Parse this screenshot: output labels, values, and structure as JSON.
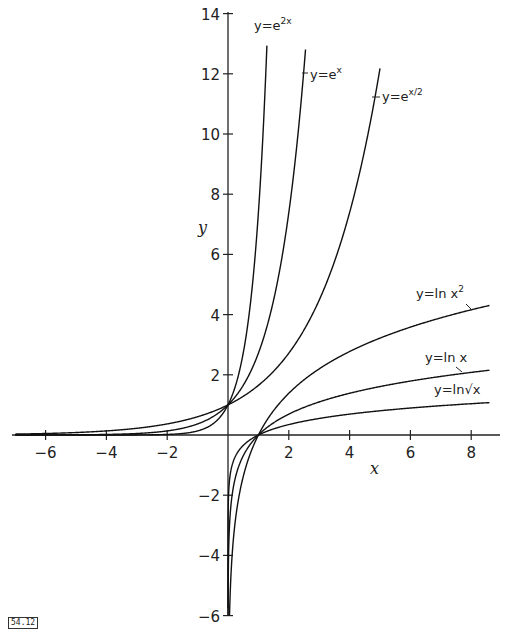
{
  "figure_id": "54.12",
  "chart_data": {
    "type": "line",
    "title": "",
    "xlabel": "x",
    "ylabel": "y",
    "xlim": [
      -7,
      9
    ],
    "ylim": [
      -6,
      14
    ],
    "grid": false,
    "legend": "inline labels",
    "x_ticks": [
      -6,
      -4,
      -2,
      2,
      4,
      6,
      8
    ],
    "y_ticks": [
      -6,
      -4,
      -2,
      2,
      4,
      6,
      8,
      10,
      12,
      14
    ],
    "series": [
      {
        "name": "y=e^{2x}",
        "label": "y=e",
        "sup": "2x",
        "expr": "exp(2x)",
        "domain": [
          -7,
          1.28
        ]
      },
      {
        "name": "y=e^{x}",
        "label": "y=e",
        "sup": "x",
        "expr": "exp(x)",
        "domain": [
          -7,
          2.55
        ]
      },
      {
        "name": "y=e^{x/2}",
        "label": "y=e",
        "sup": "x/2",
        "expr": "exp(x/2)",
        "domain": [
          -7,
          5.0
        ]
      },
      {
        "name": "y=ln x^2",
        "label": "y=ln x",
        "sup": "2",
        "expr": "2ln(x)",
        "domain": [
          0.05,
          8.6
        ]
      },
      {
        "name": "y=ln x",
        "label": "y=ln x",
        "sup": "",
        "expr": "ln(x)",
        "domain": [
          0.0025,
          8.6
        ]
      },
      {
        "name": "y=ln sqrt(x)",
        "label": "y=ln√x",
        "sup": "",
        "expr": "0.5ln(x)",
        "domain": [
          1e-05,
          8.6
        ]
      }
    ],
    "annotations": [
      {
        "text": "common point (0,1) for exponentials"
      },
      {
        "text": "common point (1,0) for logarithms"
      }
    ]
  },
  "labels": {
    "x_axis": "x",
    "y_axis": "y",
    "exp2x": {
      "base": "y=e",
      "sup": "2x"
    },
    "expx": {
      "base": "y=e",
      "sup": "x"
    },
    "exphalf": {
      "base": "y=e",
      "sup": "x/2"
    },
    "lnx2": {
      "base": "y=ln x",
      "sup": "2"
    },
    "lnx": {
      "base": "y=ln x"
    },
    "lnsqrt": {
      "base": "y=ln√x"
    }
  }
}
